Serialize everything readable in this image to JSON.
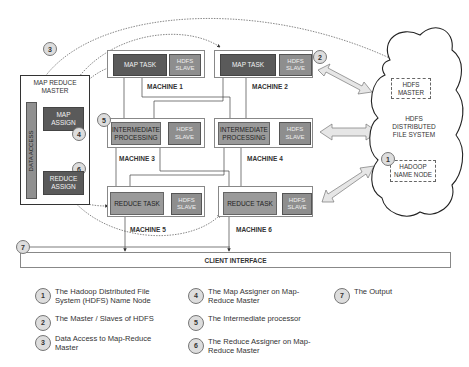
{
  "diagram": {
    "machines": [
      {
        "id": 1,
        "label": "MACHINE 1",
        "task": "MAP TASK",
        "slave": "HDFS SLAVE"
      },
      {
        "id": 2,
        "label": "MACHINE 2",
        "task": "MAP TASK",
        "slave": "HDFS SLAVE"
      },
      {
        "id": 3,
        "label": "MACHINE 3",
        "task": "INTERMEDIATE PROCESSING",
        "slave": "HDFS SLAVE"
      },
      {
        "id": 4,
        "label": "MACHINE 4",
        "task": "INTERMEDIATE PROCESSING",
        "slave": "HDFS SLAVE"
      },
      {
        "id": 5,
        "label": "MACHINE 5",
        "task": "REDUCE TASK",
        "slave": "HDFS SLAVE"
      },
      {
        "id": 6,
        "label": "MACHINE 6",
        "task": "REDUCE TASK",
        "slave": "HDFS SLAVE"
      }
    ],
    "master": {
      "title": "MAP REDUCE MASTER",
      "data_access": "DATA ACCESS",
      "map_assign": "MAP ASSIGN",
      "reduce_assign": "REDUCE ASSIGN"
    },
    "cloud": {
      "master": "HDFS MASTER",
      "label": "HDFS DISTRIBUTED FILE SYSTEM",
      "name_node": "HADOOP NAME NODE"
    },
    "client_interface": "CLIENT INTERFACE",
    "badges": [
      "1",
      "2",
      "3",
      "4",
      "5",
      "6",
      "7"
    ]
  },
  "legend": [
    {
      "num": "1",
      "text": "The Hadoop Distributed File System (HDFS) Name Node"
    },
    {
      "num": "2",
      "text": "The Master / Slaves of HDFS"
    },
    {
      "num": "3",
      "text": "Data Access to Map-Reduce Master"
    },
    {
      "num": "4",
      "text": "The Map Assigner on Map-Reduce Master"
    },
    {
      "num": "5",
      "text": "The Intermediate processor"
    },
    {
      "num": "6",
      "text": "The Reduce Assigner on Map-Reduce Master"
    },
    {
      "num": "7",
      "text": "The Output"
    }
  ]
}
